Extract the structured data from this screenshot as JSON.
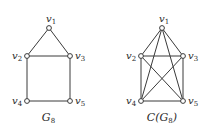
{
  "diagram": {
    "graphs": [
      {
        "id": "G8",
        "label_main": "G",
        "label_sub": "8",
        "label_prefix": "",
        "label_suffix": "",
        "nodes": [
          {
            "id": "v1",
            "name": "v",
            "sub": "1",
            "x": 49,
            "y": 28
          },
          {
            "id": "v2",
            "name": "v",
            "sub": "2",
            "x": 27,
            "y": 56
          },
          {
            "id": "v3",
            "name": "v",
            "sub": "3",
            "x": 70,
            "y": 56
          },
          {
            "id": "v4",
            "name": "v",
            "sub": "4",
            "x": 27,
            "y": 101
          },
          {
            "id": "v5",
            "name": "v",
            "sub": "5",
            "x": 70,
            "y": 101
          }
        ],
        "edges": [
          [
            "v1",
            "v2"
          ],
          [
            "v1",
            "v3"
          ],
          [
            "v2",
            "v3"
          ],
          [
            "v2",
            "v4"
          ],
          [
            "v3",
            "v5"
          ],
          [
            "v4",
            "v5"
          ]
        ]
      },
      {
        "id": "C(G8)",
        "label_main": "G",
        "label_sub": "8",
        "label_prefix": "C(",
        "label_suffix": ")",
        "nodes": [
          {
            "id": "v1",
            "name": "v",
            "sub": "1",
            "x": 162,
            "y": 28
          },
          {
            "id": "v2",
            "name": "v",
            "sub": "2",
            "x": 141,
            "y": 56
          },
          {
            "id": "v3",
            "name": "v",
            "sub": "3",
            "x": 183,
            "y": 56
          },
          {
            "id": "v4",
            "name": "v",
            "sub": "4",
            "x": 141,
            "y": 101
          },
          {
            "id": "v5",
            "name": "v",
            "sub": "5",
            "x": 183,
            "y": 101
          }
        ],
        "edges": [
          [
            "v1",
            "v2"
          ],
          [
            "v1",
            "v3"
          ],
          [
            "v1",
            "v4"
          ],
          [
            "v1",
            "v5"
          ],
          [
            "v2",
            "v3"
          ],
          [
            "v2",
            "v4"
          ],
          [
            "v2",
            "v5"
          ],
          [
            "v3",
            "v4"
          ],
          [
            "v3",
            "v5"
          ],
          [
            "v4",
            "v5"
          ]
        ]
      }
    ],
    "colors": {
      "stroke": "#3a3a3a",
      "text": "#2a2a2a",
      "background": "#ffffff"
    }
  }
}
